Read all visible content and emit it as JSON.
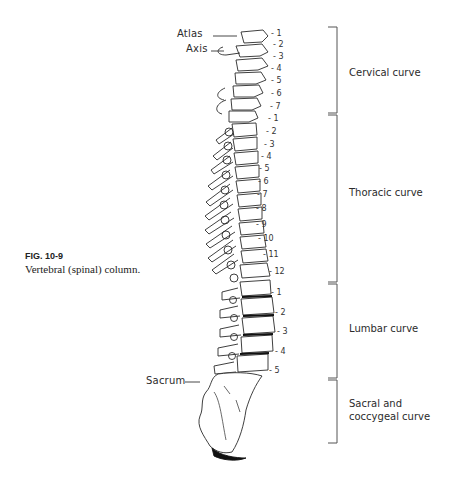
{
  "figure": {
    "number": "FIG. 10-9",
    "caption": "Vertebral (spinal) column."
  },
  "labels": {
    "atlas": "Atlas",
    "axis": "Axis",
    "sacrum": "Sacrum"
  },
  "vertebrae": {
    "cervical": [
      "1",
      "2",
      "3",
      "4",
      "5",
      "6",
      "7"
    ],
    "thoracic": [
      "1",
      "2",
      "3",
      "4",
      "5",
      "6",
      "7",
      "8",
      "9",
      "10",
      "11",
      "12"
    ],
    "lumbar": [
      "1",
      "2",
      "3",
      "4",
      "5"
    ]
  },
  "regions": [
    {
      "name": "Cervical curve",
      "line1": "Cervical curve",
      "line2": ""
    },
    {
      "name": "Thoracic curve",
      "line1": "Thoracic curve",
      "line2": ""
    },
    {
      "name": "Lumbar curve",
      "line1": "Lumbar curve",
      "line2": ""
    },
    {
      "name": "Sacral and coccygeal curve",
      "line1": "Sacral and",
      "line2": "coccygeal curve"
    }
  ],
  "colors": {
    "ink": "#2a2a2a",
    "bracket": "#555555",
    "background": "#ffffff"
  }
}
